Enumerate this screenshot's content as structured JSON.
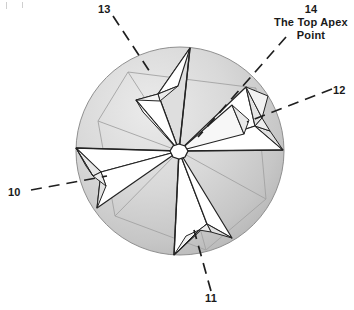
{
  "figure": {
    "type": "patent-line-drawing",
    "background_color": "#ffffff",
    "ink_color": "#1a1a1a",
    "sphere": {
      "center_x": 180,
      "center_y": 151,
      "radius": 104,
      "fill_light": "#e9e9e9",
      "fill_mid": "#c9c9c9",
      "fill_dark": "#b4b4b4",
      "outline_color": "#8c8c8c"
    },
    "apex": {
      "center_x": 179,
      "center_y": 151,
      "radius": 7,
      "fill": "#ffffff",
      "outline": "#2a2a2a",
      "label": "The Top Apex Point"
    },
    "facet_fill": "#ffffff",
    "facet_fill_shadow": "#dcdcdc",
    "facet_fill_shadow_2": "#cbcbcb",
    "star_points": 5
  },
  "callouts": [
    {
      "id": "10",
      "number": "10",
      "caption": "",
      "position": "left",
      "leader": "dashed"
    },
    {
      "id": "11",
      "number": "11",
      "caption": "",
      "position": "bottom",
      "leader": "dashed"
    },
    {
      "id": "12",
      "number": "12",
      "caption": "",
      "position": "right",
      "leader": "dashed"
    },
    {
      "id": "13",
      "number": "13",
      "caption": "",
      "position": "top-left",
      "leader": "dashed"
    },
    {
      "id": "14",
      "number": "14",
      "caption": "The Top Apex Point",
      "caption_line_1": "The Top Apex",
      "caption_line_2": "Point",
      "position": "top-right",
      "leader": "dashed"
    }
  ]
}
